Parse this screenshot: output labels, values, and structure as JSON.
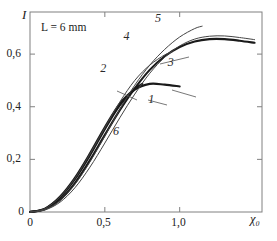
{
  "chart_data": {
    "type": "line",
    "title": "",
    "xlabel": "χ₀",
    "ylabel": "I",
    "annotation": "L = 6 mm",
    "xlim": [
      0,
      1.55
    ],
    "ylim": [
      0,
      0.76
    ],
    "grid": false,
    "legend": "inline-curve-numbers",
    "xticks": [
      0,
      0.5,
      1.0
    ],
    "xticklabels": [
      "0",
      "0,5",
      "1,0"
    ],
    "yticks": [
      0,
      0.2,
      0.4,
      0.6
    ],
    "yticklabels": [
      "0",
      "0,2",
      "0,4",
      "0,6"
    ],
    "series": [
      {
        "name": "1",
        "label": "1",
        "width": 2.1,
        "color": "#1a1a1a",
        "x": [
          0,
          0.1,
          0.2,
          0.3,
          0.4,
          0.5,
          0.6,
          0.7,
          0.8,
          0.9,
          1.0
        ],
        "y": [
          0.0,
          0.012,
          0.055,
          0.125,
          0.215,
          0.315,
          0.405,
          0.465,
          0.487,
          0.484,
          0.477
        ]
      },
      {
        "name": "2",
        "label": "2",
        "width": 2.1,
        "color": "#1a1a1a",
        "x": [
          0,
          0.1,
          0.2,
          0.3,
          0.4,
          0.5,
          0.6,
          0.7,
          0.75
        ],
        "y": [
          0.0,
          0.013,
          0.058,
          0.13,
          0.222,
          0.322,
          0.412,
          0.468,
          0.487
        ]
      },
      {
        "name": "3",
        "label": "3",
        "width": 2.1,
        "color": "#1a1a1a",
        "x": [
          0,
          0.1,
          0.2,
          0.3,
          0.4,
          0.5,
          0.6,
          0.7,
          0.8,
          0.9,
          1.0,
          1.1,
          1.2,
          1.3,
          1.4,
          1.5
        ],
        "y": [
          0.0,
          0.01,
          0.046,
          0.11,
          0.196,
          0.293,
          0.387,
          0.47,
          0.54,
          0.592,
          0.627,
          0.648,
          0.657,
          0.657,
          0.651,
          0.643
        ]
      },
      {
        "name": "4",
        "label": "4",
        "width": 1.0,
        "color": "#444444",
        "x": [
          0,
          0.1,
          0.2,
          0.3,
          0.4,
          0.5,
          0.6,
          0.7,
          0.8,
          0.9,
          0.95
        ],
        "y": [
          0.0,
          0.013,
          0.057,
          0.128,
          0.22,
          0.32,
          0.418,
          0.5,
          0.558,
          0.597,
          0.608
        ]
      },
      {
        "name": "5",
        "label": "5",
        "width": 1.0,
        "color": "#444444",
        "x": [
          0,
          0.1,
          0.2,
          0.3,
          0.4,
          0.5,
          0.6,
          0.7,
          0.8,
          0.9,
          1.0,
          1.1,
          1.15
        ],
        "y": [
          0.0,
          0.009,
          0.043,
          0.105,
          0.19,
          0.288,
          0.39,
          0.482,
          0.558,
          0.618,
          0.665,
          0.697,
          0.706
        ]
      },
      {
        "name": "6",
        "label": "6",
        "width": 1.0,
        "color": "#444444",
        "x": [
          0,
          0.1,
          0.2,
          0.3,
          0.4,
          0.5,
          0.6,
          0.7,
          0.8,
          0.9,
          1.0,
          1.1,
          1.2,
          1.3,
          1.4,
          1.5
        ],
        "y": [
          0.0,
          0.008,
          0.037,
          0.092,
          0.17,
          0.262,
          0.358,
          0.448,
          0.527,
          0.588,
          0.631,
          0.657,
          0.668,
          0.669,
          0.663,
          0.655
        ]
      }
    ],
    "curve_label_positions": [
      {
        "label": "1",
        "x": 0.81,
        "y": 0.425
      },
      {
        "label": "2",
        "x": 0.49,
        "y": 0.545
      },
      {
        "label": "3",
        "x": 0.94,
        "y": 0.565
      },
      {
        "label": "4",
        "x": 0.645,
        "y": 0.665
      },
      {
        "label": "5",
        "x": 0.855,
        "y": 0.735
      },
      {
        "label": "6",
        "x": 0.575,
        "y": 0.305
      }
    ]
  }
}
